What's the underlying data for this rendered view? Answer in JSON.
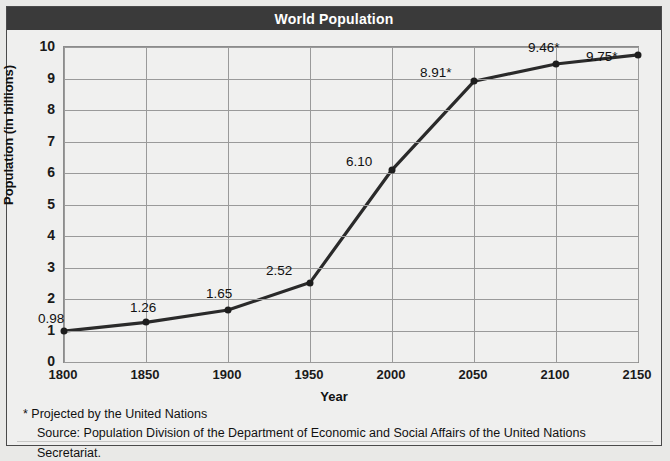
{
  "title": "World Population",
  "axes": {
    "x_title": "Year",
    "y_title": "Population (in billions)",
    "x_ticks": [
      "1800",
      "1850",
      "1900",
      "1950",
      "2000",
      "2050",
      "2100",
      "2150"
    ],
    "y_ticks": [
      "10",
      "9",
      "8",
      "7",
      "6",
      "5",
      "4",
      "3",
      "2",
      "1",
      "0"
    ]
  },
  "notes": {
    "projection": "* Projected by the United Nations",
    "source": "Source: Population Division of the Department of Economic and Social Affairs of the United Nations Secretariat."
  },
  "point_labels": [
    "0.98",
    "1.26",
    "1.65",
    "2.52",
    "6.10",
    "8.91*",
    "9.46*",
    "9.75*"
  ],
  "colors": {
    "title_bar": "#3a3a3a",
    "title_text": "#ffffff",
    "line": "#2a2a2a",
    "plot_background": "#f0f0ef",
    "gridline": "#9a9a9a",
    "figure_background": "#efefee"
  },
  "chart_data": {
    "type": "line",
    "title": "World Population",
    "xlabel": "Year",
    "ylabel": "Population (in billions)",
    "x": [
      1800,
      1850,
      1900,
      1950,
      2000,
      2050,
      2100,
      2150
    ],
    "values": [
      0.98,
      1.26,
      1.65,
      2.52,
      6.1,
      8.91,
      9.46,
      9.75
    ],
    "labels": [
      "0.98",
      "1.26",
      "1.65",
      "2.52",
      "6.10",
      "8.91*",
      "9.46*",
      "9.75*"
    ],
    "projected": [
      false,
      false,
      false,
      false,
      false,
      true,
      true,
      true
    ],
    "xlim": [
      1800,
      2150
    ],
    "ylim": [
      0,
      10
    ],
    "xtick_step": 50,
    "ytick_step": 1,
    "grid": true,
    "legend": "none",
    "markers": "filled-circle"
  }
}
